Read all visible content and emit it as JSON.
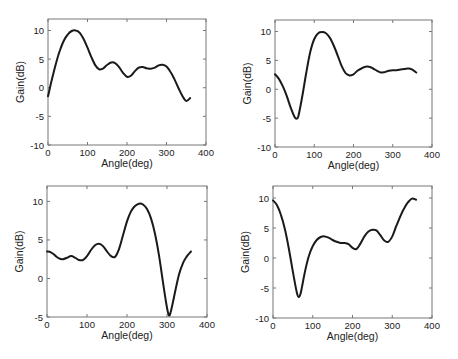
{
  "figure": {
    "width": 458,
    "height": 359,
    "layout": "2x2 grid of line plots"
  },
  "chart_data": [
    {
      "type": "line",
      "panel": "top-left",
      "title": "",
      "xlabel": "Angle(deg)",
      "ylabel": "Gain(dB)",
      "xlim": [
        0,
        400
      ],
      "ylim": [
        -10,
        12
      ],
      "xticks": [
        0,
        100,
        200,
        300,
        400
      ],
      "yticks": [
        -10,
        -5,
        0,
        5,
        10
      ],
      "grid": false,
      "legend": null,
      "x": [
        0,
        10,
        20,
        30,
        40,
        50,
        60,
        70,
        80,
        90,
        100,
        110,
        120,
        130,
        140,
        150,
        160,
        170,
        180,
        190,
        200,
        210,
        220,
        230,
        240,
        250,
        260,
        270,
        280,
        290,
        300,
        310,
        320,
        330,
        340,
        350,
        360
      ],
      "values": [
        -1.5,
        1.5,
        4.2,
        6.5,
        8.2,
        9.3,
        9.9,
        10.0,
        9.6,
        8.5,
        7.0,
        5.3,
        3.9,
        3.2,
        3.4,
        4.0,
        4.4,
        4.3,
        3.6,
        2.6,
        1.9,
        2.1,
        2.9,
        3.5,
        3.6,
        3.4,
        3.3,
        3.5,
        3.9,
        4.0,
        3.7,
        2.8,
        1.5,
        0.0,
        -1.4,
        -2.3,
        -1.8
      ]
    },
    {
      "type": "line",
      "panel": "top-right",
      "title": "",
      "xlabel": "Angle(deg)",
      "ylabel": "Gain(dB)",
      "xlim": [
        0,
        400
      ],
      "ylim": [
        -10,
        12
      ],
      "xticks": [
        0,
        100,
        200,
        300,
        400
      ],
      "yticks": [
        -10,
        -5,
        0,
        5,
        10
      ],
      "grid": false,
      "legend": null,
      "x": [
        0,
        10,
        20,
        30,
        40,
        50,
        55,
        60,
        70,
        80,
        90,
        100,
        110,
        120,
        130,
        140,
        150,
        160,
        170,
        180,
        190,
        200,
        210,
        220,
        230,
        240,
        250,
        260,
        270,
        280,
        290,
        300,
        310,
        320,
        330,
        340,
        350,
        360
      ],
      "values": [
        2.6,
        1.8,
        0.5,
        -1.2,
        -3.2,
        -4.8,
        -5.1,
        -4.5,
        -1.0,
        3.0,
        6.5,
        8.7,
        9.7,
        9.9,
        9.7,
        8.9,
        7.5,
        5.8,
        4.0,
        2.8,
        2.4,
        2.6,
        3.2,
        3.6,
        3.9,
        3.9,
        3.6,
        3.2,
        2.9,
        3.0,
        3.2,
        3.3,
        3.3,
        3.4,
        3.5,
        3.6,
        3.4,
        2.9
      ]
    },
    {
      "type": "line",
      "panel": "bottom-left",
      "title": "",
      "xlabel": "Angle(deg)",
      "ylabel": "Gain(dB)",
      "xlim": [
        0,
        400
      ],
      "ylim": [
        -5,
        12
      ],
      "xticks": [
        0,
        100,
        200,
        300,
        400
      ],
      "yticks": [
        -5,
        0,
        5,
        10
      ],
      "grid": false,
      "legend": null,
      "x": [
        0,
        10,
        20,
        30,
        40,
        50,
        60,
        70,
        80,
        90,
        100,
        110,
        120,
        130,
        140,
        150,
        160,
        170,
        180,
        190,
        200,
        210,
        220,
        230,
        240,
        250,
        260,
        270,
        280,
        290,
        300,
        305,
        310,
        320,
        330,
        340,
        350,
        360
      ],
      "values": [
        3.5,
        3.4,
        3.0,
        2.6,
        2.5,
        2.7,
        2.9,
        2.7,
        2.4,
        2.4,
        2.9,
        3.7,
        4.3,
        4.5,
        4.2,
        3.5,
        2.9,
        2.8,
        3.8,
        5.6,
        7.4,
        8.7,
        9.4,
        9.7,
        9.6,
        9.0,
        7.8,
        5.8,
        3.0,
        -0.5,
        -3.8,
        -4.8,
        -4.2,
        -1.8,
        0.5,
        2.0,
        2.9,
        3.5
      ]
    },
    {
      "type": "line",
      "panel": "bottom-right",
      "title": "",
      "xlabel": "Angle(deg)",
      "ylabel": "Gain(dB)",
      "xlim": [
        0,
        400
      ],
      "ylim": [
        -10,
        12
      ],
      "xticks": [
        0,
        100,
        200,
        300,
        400
      ],
      "yticks": [
        -10,
        -5,
        0,
        5,
        10
      ],
      "grid": false,
      "legend": null,
      "x": [
        0,
        10,
        20,
        30,
        40,
        50,
        60,
        65,
        70,
        80,
        90,
        100,
        110,
        120,
        130,
        140,
        150,
        160,
        170,
        180,
        190,
        200,
        210,
        220,
        230,
        240,
        250,
        260,
        270,
        280,
        290,
        300,
        310,
        320,
        330,
        340,
        350,
        360
      ],
      "values": [
        9.6,
        8.8,
        7.2,
        4.8,
        1.5,
        -2.3,
        -5.8,
        -6.5,
        -5.8,
        -2.4,
        0.3,
        2.0,
        3.0,
        3.5,
        3.6,
        3.4,
        3.0,
        2.7,
        2.5,
        2.5,
        2.3,
        1.7,
        1.5,
        2.4,
        3.6,
        4.4,
        4.7,
        4.6,
        3.8,
        2.9,
        2.7,
        3.6,
        5.3,
        6.9,
        8.3,
        9.3,
        9.9,
        9.7
      ]
    }
  ],
  "panels": [
    {
      "xlabel": "Angle(deg)",
      "ylabel": "Gain(dB)"
    },
    {
      "xlabel": "Angle(deg)",
      "ylabel": "Gain(dB)"
    },
    {
      "xlabel": "Angle(deg)",
      "ylabel": "Gain(dB)"
    },
    {
      "xlabel": "Angle(deg)",
      "ylabel": "Gain(dB)"
    }
  ],
  "style": {
    "line_color": "#1a1a1a",
    "axis_color": "#777777",
    "text_color": "#222222",
    "background": "#ffffff"
  }
}
